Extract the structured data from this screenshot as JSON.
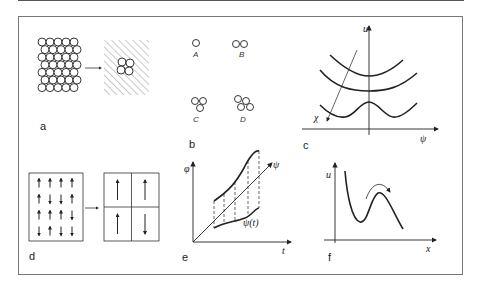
{
  "figure": {
    "panels": [
      {
        "id": "a",
        "label": "a",
        "description": "Dense random packing of circles transforms into hatched continuum with small cluster"
      },
      {
        "id": "b",
        "label": "b",
        "clusters": [
          {
            "label": "A",
            "circles": 1
          },
          {
            "label": "B",
            "circles": 2
          },
          {
            "label": "C",
            "circles": 3
          },
          {
            "label": "D",
            "circles": 4
          }
        ]
      },
      {
        "id": "c",
        "label": "c",
        "axes": {
          "y": "u",
          "x": "ψ",
          "oblique": "χ"
        },
        "curves": [
          "single-well upper",
          "single-well flat",
          "double-well"
        ]
      },
      {
        "id": "d",
        "label": "d",
        "grid_arrows": [
          [
            "up",
            "up",
            "up",
            "up"
          ],
          [
            "up",
            "down",
            "down",
            "up"
          ],
          [
            "up",
            "up",
            "up",
            "down"
          ],
          [
            "down",
            "up",
            "down",
            "down"
          ]
        ],
        "domains": [
          "up",
          "up",
          "up",
          "down"
        ]
      },
      {
        "id": "e",
        "label": "e",
        "axes": {
          "y": "φ",
          "x": "t",
          "diagonal": "ψ"
        },
        "curve_label": "ψ(t)"
      },
      {
        "id": "f",
        "label": "f",
        "axes": {
          "y": "u",
          "x": "x"
        },
        "description": "Potential well with barrier, arrow over barrier"
      }
    ]
  }
}
